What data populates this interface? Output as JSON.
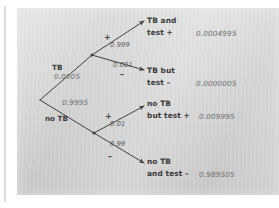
{
  "diagram": {
    "type": "probability-tree",
    "root": {
      "label": ""
    },
    "nodes": {
      "tb": {
        "label": "TB",
        "probability": "0.0005"
      },
      "no_tb": {
        "label": "no TB",
        "probability": "0.9995"
      }
    },
    "branch_probabilities": {
      "tb_pos": "0.999",
      "tb_neg": "0.001",
      "notb_pos": "0.01",
      "notb_neg": "0.99"
    },
    "signs": {
      "tb_pos": "+",
      "tb_neg": "–",
      "notb_pos": "+",
      "notb_neg": "–"
    },
    "outcomes": [
      {
        "line1": "TB and",
        "line2": "test +",
        "value": "0.0004995"
      },
      {
        "line1": "TB but",
        "line2": "test –",
        "value": "0.0000005"
      },
      {
        "line1": "no TB",
        "line2": "but test +",
        "value": "0.009995"
      },
      {
        "line1": "no TB",
        "line2": "and test –",
        "value": "0.989505"
      }
    ],
    "colors": {
      "panel": "#d5d5d5",
      "ink": "#3a3a3a",
      "probability_ink": "#6b6b6b",
      "page": "#ffffff"
    }
  }
}
